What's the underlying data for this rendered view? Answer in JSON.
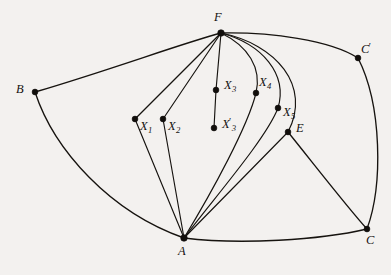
{
  "figure": {
    "type": "planar-graph-diagram",
    "background_color": "#f3f1ef",
    "line_color": "#16130f",
    "width": 391,
    "height": 275
  },
  "vertices": [
    {
      "id": "F",
      "label": "F",
      "sub": "",
      "prime": false,
      "x": 221,
      "y": 33,
      "label_x": 214,
      "label_y": 11
    },
    {
      "id": "B",
      "label": "B",
      "sub": "",
      "prime": false,
      "x": 35,
      "y": 92,
      "label_x": 16,
      "label_y": 83
    },
    {
      "id": "A",
      "label": "A",
      "sub": "",
      "prime": false,
      "x": 184,
      "y": 238,
      "label_x": 178,
      "label_y": 245
    },
    {
      "id": "C",
      "label": "C",
      "sub": "",
      "prime": false,
      "x": 367,
      "y": 229,
      "label_x": 366,
      "label_y": 234
    },
    {
      "id": "Cp",
      "label": "C",
      "sub": "",
      "prime": true,
      "x": 358,
      "y": 58,
      "label_x": 361,
      "label_y": 42
    },
    {
      "id": "E",
      "label": "E",
      "sub": "",
      "prime": false,
      "x": 288,
      "y": 132,
      "label_x": 296,
      "label_y": 122
    },
    {
      "id": "X1",
      "label": "X",
      "sub": "1",
      "prime": false,
      "x": 135,
      "y": 119,
      "label_x": 140,
      "label_y": 120
    },
    {
      "id": "X2",
      "label": "X",
      "sub": "2",
      "prime": false,
      "x": 163,
      "y": 119,
      "label_x": 168,
      "label_y": 120
    },
    {
      "id": "X3",
      "label": "X",
      "sub": "3",
      "prime": false,
      "x": 216,
      "y": 90,
      "label_x": 224,
      "label_y": 79
    },
    {
      "id": "X3p",
      "label": "X",
      "sub": "3",
      "prime": true,
      "x": 214,
      "y": 128,
      "label_x": 222,
      "label_y": 117
    },
    {
      "id": "X4",
      "label": "X",
      "sub": "4",
      "prime": false,
      "x": 256,
      "y": 93,
      "label_x": 259,
      "label_y": 76
    },
    {
      "id": "X5",
      "label": "X",
      "sub": "5",
      "prime": false,
      "x": 278,
      "y": 108,
      "label_x": 283,
      "label_y": 106
    }
  ],
  "edges": [
    {
      "id": "F-B",
      "from": "F",
      "to": "B",
      "shape": "curve"
    },
    {
      "id": "B-A",
      "from": "B",
      "to": "A",
      "shape": "curve"
    },
    {
      "id": "A-C",
      "from": "A",
      "to": "C",
      "shape": "curve"
    },
    {
      "id": "F-Cp",
      "from": "F",
      "to": "Cp",
      "shape": "curve"
    },
    {
      "id": "Cp-C",
      "from": "Cp",
      "to": "C",
      "shape": "curve"
    },
    {
      "id": "E-C",
      "from": "E",
      "to": "C",
      "shape": "line"
    },
    {
      "id": "F-X1",
      "from": "F",
      "to": "X1",
      "shape": "line"
    },
    {
      "id": "X1-A",
      "from": "X1",
      "to": "A",
      "shape": "line"
    },
    {
      "id": "F-X2",
      "from": "F",
      "to": "X2",
      "shape": "line"
    },
    {
      "id": "X2-A",
      "from": "X2",
      "to": "A",
      "shape": "line"
    },
    {
      "id": "F-X3",
      "from": "F",
      "to": "X3",
      "shape": "line"
    },
    {
      "id": "X3-X3p",
      "from": "X3",
      "to": "X3p",
      "shape": "line"
    },
    {
      "id": "F-X4",
      "from": "F",
      "to": "X4",
      "shape": "curve"
    },
    {
      "id": "X4-A",
      "from": "X4",
      "to": "A",
      "shape": "curve"
    },
    {
      "id": "F-X5",
      "from": "F",
      "to": "X5",
      "shape": "curve"
    },
    {
      "id": "X5-A",
      "from": "X5",
      "to": "A",
      "shape": "curve"
    },
    {
      "id": "F-E",
      "from": "F",
      "to": "E",
      "shape": "curve"
    },
    {
      "id": "E-A",
      "from": "E",
      "to": "A",
      "shape": "line"
    }
  ]
}
